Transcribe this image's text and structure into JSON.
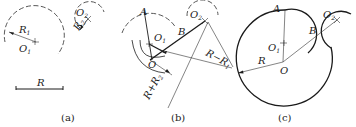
{
  "figure": {
    "panels": [
      {
        "id": "a",
        "caption": "(a)",
        "labels": {
          "R1": "R",
          "R1_sub": "1",
          "O1": "O",
          "O1_sub": "1",
          "R2": "R",
          "R2_sub": "2",
          "O2": "O",
          "O2_sub": "2",
          "R": "R"
        }
      },
      {
        "id": "b",
        "caption": "(b)",
        "labels": {
          "A": "A",
          "B": "B",
          "O": "O",
          "O1": "O",
          "O1_sub": "1",
          "O2": "O",
          "O2_sub": "2",
          "R_minus_R1": "R−R",
          "R_minus_R1_sub": "1",
          "R_plus_R2": "R+R",
          "R_plus_R2_sub": "2"
        }
      },
      {
        "id": "c",
        "caption": "(c)",
        "labels": {
          "A": "A",
          "B": "B",
          "O": "O",
          "O1": "O",
          "O1_sub": "1",
          "O2": "O",
          "O2_sub": "2",
          "R": "R"
        }
      }
    ]
  }
}
